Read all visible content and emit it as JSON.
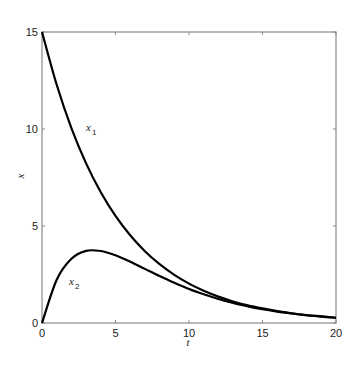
{
  "chart_data": {
    "type": "line",
    "title": "",
    "xlabel": "t",
    "ylabel": "x",
    "xlim": [
      0,
      20
    ],
    "ylim": [
      0,
      15
    ],
    "xticks": [
      0,
      5,
      10,
      15,
      20
    ],
    "yticks": [
      0,
      5,
      10,
      15
    ],
    "grid": false,
    "legend": "inline labels",
    "x": [
      0,
      1,
      2,
      3,
      4,
      5,
      6,
      7,
      8,
      9,
      10,
      11,
      12,
      13,
      14,
      15,
      16,
      17,
      18,
      19,
      20
    ],
    "series": [
      {
        "name": "x1",
        "label_main": "x",
        "label_sub": "1",
        "values": [
          15.0,
          12.28,
          10.05,
          8.23,
          6.74,
          5.52,
          4.52,
          3.7,
          3.03,
          2.48,
          2.03,
          1.66,
          1.36,
          1.11,
          0.91,
          0.75,
          0.61,
          0.5,
          0.41,
          0.34,
          0.27
        ],
        "color": "#000000"
      },
      {
        "name": "x2",
        "label_main": "x",
        "label_sub": "2",
        "values": [
          0.0,
          2.23,
          3.31,
          3.72,
          3.71,
          3.49,
          3.16,
          2.79,
          2.42,
          2.07,
          1.75,
          1.48,
          1.24,
          1.03,
          0.86,
          0.71,
          0.59,
          0.49,
          0.4,
          0.33,
          0.27
        ],
        "color": "#000000"
      }
    ]
  }
}
